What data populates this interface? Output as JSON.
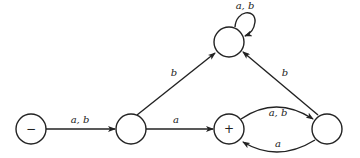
{
  "diagram": {
    "type": "finite-automaton",
    "states": [
      {
        "id": "s0",
        "label": "−",
        "role": "start",
        "cx": 31,
        "cy": 129
      },
      {
        "id": "s1",
        "label": "",
        "cx": 131,
        "cy": 129
      },
      {
        "id": "s2",
        "label": "+",
        "role": "final",
        "cx": 229,
        "cy": 129
      },
      {
        "id": "s3",
        "label": "",
        "role": "trap",
        "cx": 229,
        "cy": 42
      },
      {
        "id": "s4",
        "label": "",
        "cx": 327,
        "cy": 129
      }
    ],
    "transitions": [
      {
        "from": "s0",
        "to": "s1",
        "label": "a, b"
      },
      {
        "from": "s1",
        "to": "s2",
        "label": "a"
      },
      {
        "from": "s1",
        "to": "s3",
        "label": "b"
      },
      {
        "from": "s3",
        "to": "s3",
        "label": "a, b"
      },
      {
        "from": "s2",
        "to": "s4",
        "label": "a, b"
      },
      {
        "from": "s4",
        "to": "s2",
        "label": "a"
      },
      {
        "from": "s4",
        "to": "s3",
        "label": "b"
      }
    ]
  }
}
